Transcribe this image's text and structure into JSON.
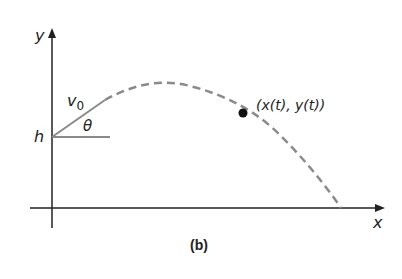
{
  "figure": {
    "caption": "(b)",
    "axes": {
      "x_label": "x",
      "y_label": "y"
    },
    "labels": {
      "initial_height": "h",
      "initial_velocity": "v",
      "initial_velocity_subscript": "0",
      "launch_angle": "θ",
      "point": "(x(t), y(t))"
    },
    "colors": {
      "axis": "#222222",
      "trajectory": "#8a8a8a",
      "vector": "#8a8a8a",
      "point": "#111111"
    }
  }
}
